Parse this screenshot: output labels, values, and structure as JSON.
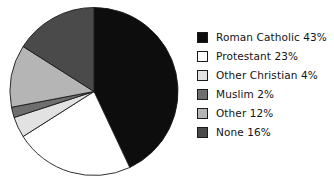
{
  "chart_data": {
    "type": "pie",
    "title": "",
    "subtitle": "",
    "xlabel": "",
    "ylabel": "",
    "grid": false,
    "legend_position": "right",
    "start_angle_deg": 0,
    "direction": "clockwise",
    "categories": [
      "Roman Catholic",
      "Protestant",
      "Other Christian",
      "Muslim",
      "Other",
      "None"
    ],
    "values": [
      43,
      23,
      4,
      2,
      12,
      16
    ],
    "units": "%",
    "colors": [
      "#0d0d0d",
      "#ffffff",
      "#e2e2e2",
      "#6e6e6e",
      "#b5b5b5",
      "#4a4a4a"
    ],
    "slice_edge_color": "#1a1a1a",
    "labels": [
      "Roman Catholic 43%",
      "Protestant 23%",
      "Other Christian 4%",
      "Muslim 2%",
      "Other 12%",
      "None 16%"
    ]
  },
  "legend": {
    "items": [
      {
        "label": "Roman Catholic 43%",
        "swatch": "#0d0d0d",
        "name": "roman-catholic"
      },
      {
        "label": "Protestant 23%",
        "swatch": "#ffffff",
        "name": "protestant"
      },
      {
        "label": "Other Christian 4%",
        "swatch": "#e2e2e2",
        "name": "other-christian"
      },
      {
        "label": "Muslim 2%",
        "swatch": "#6e6e6e",
        "name": "muslim"
      },
      {
        "label": "Other 12%",
        "swatch": "#b5b5b5",
        "name": "other"
      },
      {
        "label": "None 16%",
        "swatch": "#4a4a4a",
        "name": "none"
      }
    ]
  }
}
